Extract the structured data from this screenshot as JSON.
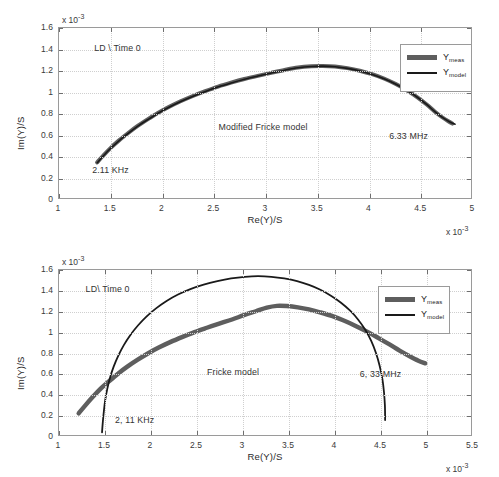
{
  "figure": {
    "top": {
      "name": "modified-fricke-plot",
      "annotations": {
        "dataset": "LD \\ Time 0",
        "model": "Modified Fricke model",
        "low_freq": "2.11 KHz",
        "high_freq": "6.33 MHz"
      },
      "legend": [
        {
          "label": "Y",
          "sub": "meas",
          "color": "#5e5e5e",
          "style": "thick-gray"
        },
        {
          "label": "Y",
          "sub": "model",
          "color": "#1a1a1a",
          "style": "thin-black"
        }
      ],
      "exponent_x": "x 10",
      "exponent_y": "x 10",
      "exponent_power": "-3"
    },
    "bottom": {
      "name": "fricke-plot",
      "annotations": {
        "dataset": "LD\\ Time 0",
        "model": "Fricke model",
        "low_freq": "2, 11 KHz",
        "high_freq": "6, 33 MHz"
      },
      "legend": [
        {
          "label": "Y",
          "sub": "meas",
          "color": "#5e5e5e",
          "style": "thick-gray"
        },
        {
          "label": "Y",
          "sub": "model",
          "color": "#1a1a1a",
          "style": "thin-black"
        }
      ],
      "exponent_x": "x 10",
      "exponent_y": "x 10",
      "exponent_power": "-3"
    }
  },
  "chart_data": [
    {
      "id": "top",
      "type": "line",
      "title": "Modified Fricke model",
      "xlabel": "Re(Y)/S",
      "ylabel": "Im(Y)/S",
      "x_scale_exponent": -3,
      "y_scale_exponent": -3,
      "xlim": [
        1,
        5
      ],
      "ylim": [
        0,
        1.6
      ],
      "xticks": [
        1,
        1.5,
        2,
        2.5,
        3,
        3.5,
        4,
        4.5,
        5
      ],
      "yticks": [
        0,
        0.2,
        0.4,
        0.6,
        0.8,
        1,
        1.2,
        1.4,
        1.6
      ],
      "grid": true,
      "legend_position": "top-right",
      "annotations": [
        {
          "text": "LD \\ Time 0",
          "x": 1.35,
          "y": 1.4
        },
        {
          "text": "Modified Fricke model",
          "x": 2.55,
          "y": 0.66
        },
        {
          "text": "2.11 KHz",
          "x": 1.33,
          "y": 0.26
        },
        {
          "text": "6.33 MHz",
          "x": 4.2,
          "y": 0.58
        }
      ],
      "series": [
        {
          "name": "Y_meas",
          "color": "#5e5e5e",
          "width": 4,
          "points": [
            [
              1.37,
              0.335
            ],
            [
              1.43,
              0.4
            ],
            [
              1.5,
              0.47
            ],
            [
              1.58,
              0.54
            ],
            [
              1.67,
              0.61
            ],
            [
              1.76,
              0.676
            ],
            [
              1.86,
              0.74
            ],
            [
              1.96,
              0.8
            ],
            [
              2.07,
              0.858
            ],
            [
              2.18,
              0.91
            ],
            [
              2.3,
              0.96
            ],
            [
              2.42,
              1.005
            ],
            [
              2.545,
              1.048
            ],
            [
              2.67,
              1.085
            ],
            [
              2.8,
              1.12
            ],
            [
              2.93,
              1.15
            ],
            [
              3.06,
              1.178
            ],
            [
              3.19,
              1.205
            ],
            [
              3.32,
              1.228
            ],
            [
              3.45,
              1.24
            ],
            [
              3.56,
              1.243
            ],
            [
              3.68,
              1.238
            ],
            [
              3.8,
              1.222
            ],
            [
              3.92,
              1.198
            ],
            [
              4.04,
              1.165
            ],
            [
              4.16,
              1.122
            ],
            [
              4.27,
              1.072
            ],
            [
              4.38,
              1.012
            ],
            [
              4.48,
              0.948
            ],
            [
              4.57,
              0.88
            ],
            [
              4.65,
              0.812
            ],
            [
              4.72,
              0.76
            ],
            [
              4.78,
              0.722
            ],
            [
              4.82,
              0.7
            ]
          ]
        },
        {
          "name": "Y_model",
          "color": "#1a1a1a",
          "width": 1.6,
          "points": [
            [
              1.372,
              0.332
            ],
            [
              1.432,
              0.398
            ],
            [
              1.502,
              0.468
            ],
            [
              1.582,
              0.538
            ],
            [
              1.672,
              0.608
            ],
            [
              1.762,
              0.674
            ],
            [
              1.862,
              0.738
            ],
            [
              1.962,
              0.798
            ],
            [
              2.072,
              0.856
            ],
            [
              2.182,
              0.908
            ],
            [
              2.302,
              0.958
            ],
            [
              2.422,
              1.003
            ],
            [
              2.547,
              1.046
            ],
            [
              2.672,
              1.083
            ],
            [
              2.802,
              1.118
            ],
            [
              2.932,
              1.148
            ],
            [
              3.062,
              1.176
            ],
            [
              3.192,
              1.203
            ],
            [
              3.322,
              1.226
            ],
            [
              3.452,
              1.238
            ],
            [
              3.562,
              1.241
            ],
            [
              3.682,
              1.236
            ],
            [
              3.802,
              1.22
            ],
            [
              3.922,
              1.196
            ],
            [
              4.042,
              1.163
            ],
            [
              4.162,
              1.12
            ],
            [
              4.272,
              1.07
            ],
            [
              4.382,
              1.01
            ],
            [
              4.482,
              0.946
            ],
            [
              4.572,
              0.878
            ],
            [
              4.652,
              0.81
            ],
            [
              4.722,
              0.758
            ],
            [
              4.79,
              0.718
            ],
            [
              4.845,
              0.695
            ]
          ]
        }
      ]
    },
    {
      "id": "bottom",
      "type": "line",
      "title": "Fricke model",
      "xlabel": "Re(Y)/S",
      "ylabel": "Im(Y)/S",
      "x_scale_exponent": -3,
      "y_scale_exponent": -3,
      "xlim": [
        1,
        5.5
      ],
      "ylim": [
        0,
        1.6
      ],
      "xticks": [
        1,
        1.5,
        2,
        2.5,
        3,
        3.5,
        4,
        4.5,
        5,
        5.5
      ],
      "yticks": [
        0,
        0.2,
        0.4,
        0.6,
        0.8,
        1,
        1.2,
        1.4,
        1.6
      ],
      "grid": true,
      "legend_position": "top-right",
      "annotations": [
        {
          "text": "LD\\ Time 0",
          "x": 1.3,
          "y": 1.4
        },
        {
          "text": "Fricke model",
          "x": 2.62,
          "y": 0.6
        },
        {
          "text": "2, 11 KHz",
          "x": 1.62,
          "y": 0.14
        },
        {
          "text": "6, 33 MHz",
          "x": 4.28,
          "y": 0.58
        }
      ],
      "series": [
        {
          "name": "Y_meas",
          "color": "#5e5e5e",
          "width": 4.5,
          "points": [
            [
              1.215,
              0.21
            ],
            [
              1.29,
              0.29
            ],
            [
              1.37,
              0.37
            ],
            [
              1.45,
              0.445
            ],
            [
              1.545,
              0.52
            ],
            [
              1.645,
              0.595
            ],
            [
              1.75,
              0.665
            ],
            [
              1.86,
              0.73
            ],
            [
              1.975,
              0.793
            ],
            [
              2.095,
              0.85
            ],
            [
              2.22,
              0.903
            ],
            [
              2.35,
              0.952
            ],
            [
              2.48,
              0.998
            ],
            [
              2.615,
              1.04
            ],
            [
              2.75,
              1.08
            ],
            [
              2.89,
              1.12
            ],
            [
              3.02,
              1.162
            ],
            [
              3.15,
              1.2
            ],
            [
              3.27,
              1.235
            ],
            [
              3.38,
              1.252
            ],
            [
              3.49,
              1.25
            ],
            [
              3.61,
              1.238
            ],
            [
              3.73,
              1.218
            ],
            [
              3.85,
              1.19
            ],
            [
              3.98,
              1.155
            ],
            [
              4.11,
              1.11
            ],
            [
              4.24,
              1.058
            ],
            [
              4.37,
              1.0
            ],
            [
              4.49,
              0.94
            ],
            [
              4.61,
              0.878
            ],
            [
              4.72,
              0.818
            ],
            [
              4.83,
              0.763
            ],
            [
              4.925,
              0.72
            ],
            [
              5.0,
              0.695
            ]
          ]
        },
        {
          "name": "Y_model",
          "color": "#1a1a1a",
          "width": 1.8,
          "points": [
            [
              1.47,
              0.025
            ],
            [
              1.478,
              0.12
            ],
            [
              1.49,
              0.23
            ],
            [
              1.505,
              0.34
            ],
            [
              1.528,
              0.45
            ],
            [
              1.558,
              0.558
            ],
            [
              1.598,
              0.665
            ],
            [
              1.648,
              0.77
            ],
            [
              1.708,
              0.872
            ],
            [
              1.78,
              0.97
            ],
            [
              1.862,
              1.062
            ],
            [
              1.955,
              1.148
            ],
            [
              2.06,
              1.228
            ],
            [
              2.175,
              1.3
            ],
            [
              2.3,
              1.362
            ],
            [
              2.435,
              1.415
            ],
            [
              2.58,
              1.458
            ],
            [
              2.73,
              1.492
            ],
            [
              2.88,
              1.518
            ],
            [
              3.03,
              1.534
            ],
            [
              3.175,
              1.54
            ],
            [
              3.32,
              1.534
            ],
            [
              3.46,
              1.518
            ],
            [
              3.6,
              1.492
            ],
            [
              3.73,
              1.455
            ],
            [
              3.855,
              1.408
            ],
            [
              3.97,
              1.35
            ],
            [
              4.08,
              1.282
            ],
            [
              4.18,
              1.205
            ],
            [
              4.268,
              1.118
            ],
            [
              4.345,
              1.02
            ],
            [
              4.41,
              0.912
            ],
            [
              4.462,
              0.795
            ],
            [
              4.502,
              0.672
            ],
            [
              4.532,
              0.545
            ],
            [
              4.55,
              0.412
            ],
            [
              4.56,
              0.28
            ],
            [
              4.562,
              0.145
            ]
          ]
        }
      ]
    }
  ]
}
